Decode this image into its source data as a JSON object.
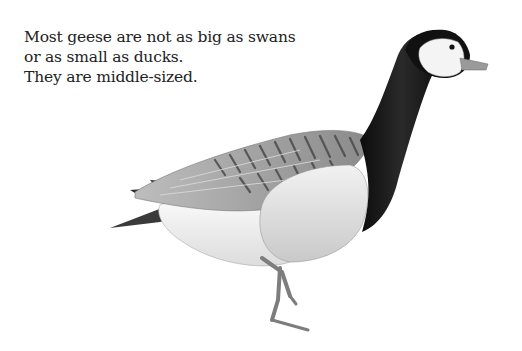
{
  "page": {
    "text_lines": [
      "Most geese are not as big as swans",
      "or as small as ducks.",
      "They are middle-sized."
    ],
    "illustration": {
      "subject": "goose-illustration",
      "style": "pencil drawing",
      "colors": {
        "neck": "#141414",
        "face": "#f4f4f4",
        "breast": "#e6e6e6",
        "wing_light": "#d6d6d6",
        "wing_dark": "#6a6a6a",
        "belly": "#f7f7f7",
        "legs": "#8c8c8c",
        "beak": "#9a9a9a"
      }
    }
  }
}
